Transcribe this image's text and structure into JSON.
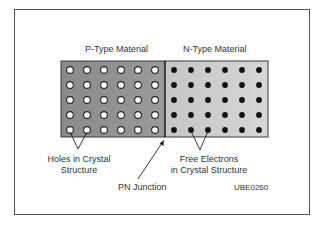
{
  "diagram": {
    "p_region_title": "P-Type Material",
    "n_region_title": "N-Type Material",
    "holes_label_line1": "Holes in Crystal",
    "holes_label_line2": "Structure",
    "electrons_label_line1": "Free Electrons",
    "electrons_label_line2": "in Crystal Structure",
    "junction_label": "PN Junction",
    "figure_code": "UBE0260",
    "grid": {
      "rows": 5,
      "p_columns": 6,
      "n_columns": 6
    },
    "colors": {
      "p_fill": "#8f8f8f",
      "n_fill": "#cfcfcf",
      "border": "#3a3a3a",
      "hole_fill": "#ffffff",
      "electron_fill": "#111111",
      "text": "#333333"
    }
  }
}
